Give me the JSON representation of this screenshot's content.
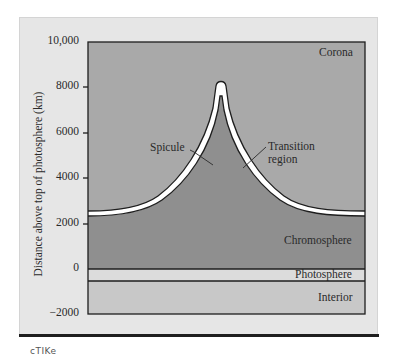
{
  "figure": {
    "y_axis": {
      "title": "Distance above top of photosphere (km)",
      "ticks": [
        "10,000",
        "8000",
        "6000",
        "4000",
        "2000",
        "0",
        "−2000"
      ]
    },
    "regions": {
      "corona": "Corona",
      "chromosphere": "Chromosphere",
      "photosphere": "Photosphere",
      "interior": "Interior"
    },
    "annotations": {
      "spicule": "Spicule",
      "transition_line1": "Transition",
      "transition_line2": "region"
    },
    "colors": {
      "panel_bg": "#e6e6e6",
      "corona": "#a9a9a9",
      "chromosphere": "#8f8f8f",
      "photosphere": "#dcdcdc",
      "interior": "#c8c8c8",
      "transition_band": "#ffffff",
      "outline": "#1e1e1e"
    },
    "layers_km": {
      "interior": [
        -2000,
        -500
      ],
      "photosphere": [
        -500,
        0
      ],
      "chromosphere": [
        0,
        2300
      ],
      "transition_region_base": 2300,
      "spicule_tip": 8200,
      "corona_top": 10000
    }
  },
  "footer": {
    "fragment_text": "cTIKe"
  }
}
